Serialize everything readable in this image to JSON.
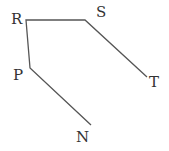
{
  "diagram": {
    "type": "polyline",
    "color": "#555555",
    "points": {
      "N": {
        "x": 91,
        "y": 125,
        "label_x": 76,
        "label_y": 142
      },
      "P": {
        "x": 30,
        "y": 68,
        "label_x": 13,
        "label_y": 80
      },
      "R": {
        "x": 26,
        "y": 20,
        "label_x": 11,
        "label_y": 24
      },
      "S": {
        "x": 85,
        "y": 20,
        "label_x": 96,
        "label_y": 17
      },
      "T": {
        "x": 147,
        "y": 77,
        "label_x": 149,
        "label_y": 87
      }
    },
    "labels": {
      "N": "N",
      "P": "P",
      "R": "R",
      "S": "S",
      "T": "T"
    },
    "segments": [
      [
        "N",
        "P"
      ],
      [
        "P",
        "R"
      ],
      [
        "R",
        "S"
      ],
      [
        "S",
        "T"
      ]
    ]
  }
}
